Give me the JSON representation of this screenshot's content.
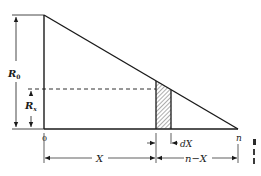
{
  "diagram": {
    "type": "triangular-distribution-with-strip",
    "labels": {
      "r0_main": "R",
      "r0_sub": "0",
      "rx_main": "R",
      "rx_sub": "x",
      "origin": "0",
      "end": "n",
      "dx": "dX",
      "x_span": "X",
      "remaining_span": "n−X"
    },
    "colors": {
      "ink": "#1a1a1a",
      "background": "#ffffff"
    }
  }
}
